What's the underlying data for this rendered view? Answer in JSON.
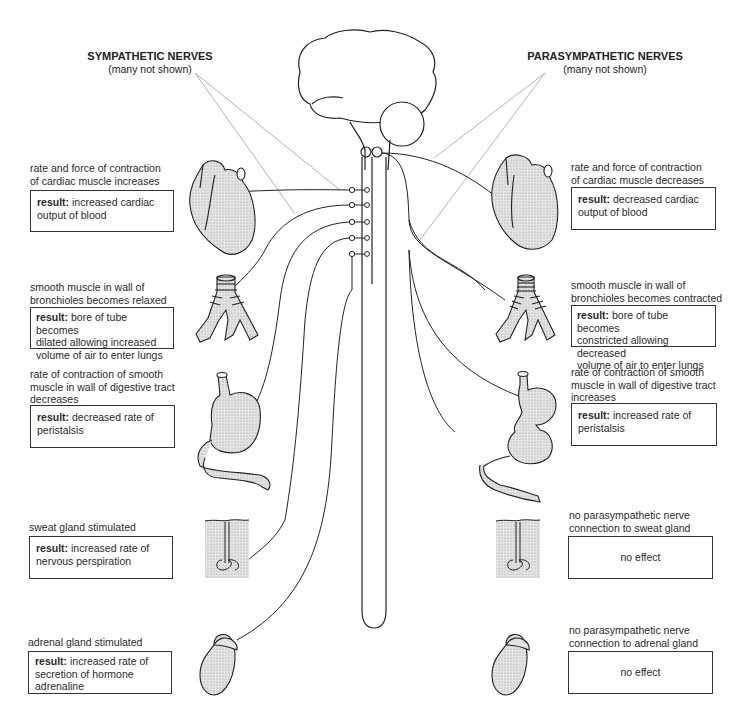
{
  "headings": {
    "sympathetic": {
      "title": "SYMPATHETIC NERVES",
      "subtitle": "(many not shown)"
    },
    "parasympathetic": {
      "title": "PARASYMPATHETIC NERVES",
      "subtitle": "(many not shown)"
    }
  },
  "sympathetic": {
    "heart": {
      "caption": [
        "rate and force of contraction",
        "of cardiac muscle increases"
      ],
      "result_label": "result:",
      "result_text": [
        "increased cardiac",
        "output of blood"
      ]
    },
    "bronchioles": {
      "caption": [
        "smooth muscle in wall of",
        "bronchioles becomes relaxed"
      ],
      "result_label": "result:",
      "result_text": [
        "bore of tube becomes",
        "dilated allowing increased",
        "volume of air to enter lungs"
      ]
    },
    "digestive": {
      "caption": [
        "rate of contraction of smooth",
        "muscle in wall of digestive tract",
        "decreases"
      ],
      "result_label": "result:",
      "result_text": [
        "decreased rate of",
        "peristalsis"
      ]
    },
    "sweat": {
      "caption": [
        "sweat gland stimulated"
      ],
      "result_label": "result:",
      "result_text": [
        "increased rate of",
        "nervous perspiration"
      ]
    },
    "adrenal": {
      "caption": [
        "adrenal gland stimulated"
      ],
      "result_label": "result:",
      "result_text": [
        "increased rate of",
        "secretion of hormone",
        "adrenaline"
      ]
    }
  },
  "parasympathetic": {
    "heart": {
      "caption": [
        "rate and force of contraction",
        "of cardiac muscle decreases"
      ],
      "result_label": "result:",
      "result_text": [
        "decreased cardiac",
        "output of blood"
      ]
    },
    "bronchioles": {
      "caption": [
        "smooth muscle in wall of",
        "bronchioles becomes contracted"
      ],
      "result_label": "result:",
      "result_text": [
        "bore of tube becomes",
        "constricted allowing decreased",
        "volume of air to enter lungs"
      ]
    },
    "digestive": {
      "caption": [
        "rate of contraction of smooth",
        "muscle in wall of digestive tract",
        "increases"
      ],
      "result_label": "result:",
      "result_text": [
        "increased rate of",
        "peristalsis"
      ]
    },
    "sweat": {
      "caption": [
        "no parasympathetic nerve",
        "connection to sweat gland"
      ],
      "result_text": "no effect"
    },
    "adrenal": {
      "caption": [
        "no parasympathetic nerve",
        "connection to adrenal gland"
      ],
      "result_text": "no effect"
    }
  },
  "icons": {
    "brain": "brain-icon",
    "spinal_cord": "spinal-cord-icon",
    "heart": "heart-icon",
    "bronchioles": "bronchioles-icon",
    "stomach": "stomach-icon",
    "sweat_gland": "sweat-gland-icon",
    "adrenal_gland": "adrenal-gland-icon"
  },
  "colors": {
    "line": "#222222",
    "pointer_line": "#aaaaaa",
    "organ_fill": "#d9d9d9",
    "box_border": "#333333"
  }
}
